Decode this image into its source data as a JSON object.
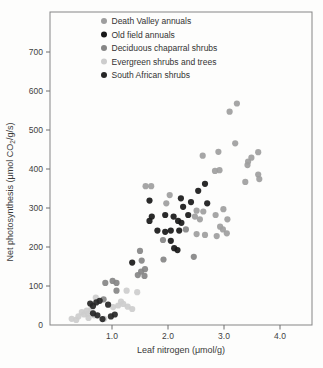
{
  "figure": {
    "x_tick_labels": [
      "1.0",
      "2.0",
      "3.0",
      "4.0"
    ],
    "y_tick_labels": [
      "0",
      "100",
      "200",
      "300",
      "400",
      "500",
      "600",
      "700"
    ],
    "xlabel": "Leaf nitrogen (μmol/g)",
    "ylabel_pre": "Net photosynthesis (μmol CO",
    "ylabel_sub": "2",
    "ylabel_post": "/g/s)",
    "frame_color": "#858585",
    "tick_color": "#6e6e6e",
    "label_color": "#3f3f3f"
  },
  "legend": {
    "items": [
      {
        "label": "Death Valley annuals",
        "color": "#9e9e9e"
      },
      {
        "label": "Old field annuals",
        "color": "#181818"
      },
      {
        "label": "Deciduous chaparral shrubs",
        "color": "#868686"
      },
      {
        "label": "Evergreen shrubs and trees",
        "color": "#cdcdcd"
      },
      {
        "label": "South African shrubs",
        "color": "#262626"
      }
    ]
  },
  "chart_data": {
    "type": "scatter",
    "title": "",
    "xlabel": "Leaf nitrogen (μmol/g)",
    "ylabel": "Net photosynthesis (μmol CO2/g/s)",
    "xlim": [
      0,
      4.6
    ],
    "ylim": [
      0,
      800
    ],
    "x_ticks": [
      1.0,
      2.0,
      3.0,
      4.0
    ],
    "y_ticks": [
      0,
      100,
      200,
      300,
      400,
      500,
      600,
      700
    ],
    "grid": false,
    "legend_position": "top-inside",
    "series": [
      {
        "name": "Evergreen shrubs and trees",
        "color": "#cdcdcd",
        "points": [
          [
            0.28,
            16
          ],
          [
            0.36,
            13
          ],
          [
            0.4,
            22
          ],
          [
            0.46,
            33
          ],
          [
            0.5,
            27
          ],
          [
            0.55,
            37
          ],
          [
            0.57,
            29
          ],
          [
            0.58,
            18
          ],
          [
            0.63,
            40
          ],
          [
            0.68,
            25
          ],
          [
            0.71,
            70
          ],
          [
            0.86,
            16
          ],
          [
            1.02,
            46
          ],
          [
            1.11,
            50
          ],
          [
            1.16,
            60
          ],
          [
            1.2,
            54
          ],
          [
            1.26,
            88
          ],
          [
            1.28,
            47
          ],
          [
            1.36,
            41
          ],
          [
            1.45,
            84
          ]
        ]
      },
      {
        "name": "Deciduous chaparral shrubs",
        "color": "#868686",
        "points": [
          [
            2.32,
            245
          ],
          [
            2.46,
            175
          ],
          [
            1.91,
            218
          ],
          [
            1.92,
            168
          ],
          [
            1.5,
            190
          ],
          [
            1.53,
            165
          ],
          [
            1.59,
            143
          ],
          [
            1.52,
            137
          ],
          [
            1.46,
            128
          ],
          [
            1.58,
            126
          ],
          [
            1.01,
            113
          ],
          [
            0.88,
            108
          ],
          [
            1.08,
            108
          ],
          [
            1.08,
            88
          ],
          [
            0.85,
            66
          ]
        ]
      },
      {
        "name": "Death Valley annuals",
        "color": "#9e9e9e",
        "points": [
          [
            3.23,
            568
          ],
          [
            3.1,
            547
          ],
          [
            3.2,
            466
          ],
          [
            2.9,
            444
          ],
          [
            2.62,
            434
          ],
          [
            3.61,
            443
          ],
          [
            3.49,
            429
          ],
          [
            3.43,
            419
          ],
          [
            3.42,
            410
          ],
          [
            2.92,
            397
          ],
          [
            2.84,
            395
          ],
          [
            3.61,
            386
          ],
          [
            3.63,
            374
          ],
          [
            3.38,
            367
          ],
          [
            1.6,
            356
          ],
          [
            1.7,
            356
          ],
          [
            2.03,
            333
          ],
          [
            1.97,
            312
          ],
          [
            2.99,
            297
          ],
          [
            2.51,
            293
          ],
          [
            2.63,
            291
          ],
          [
            2.85,
            282
          ],
          [
            2.48,
            278
          ],
          [
            2.57,
            271
          ],
          [
            3.06,
            271
          ],
          [
            2.93,
            252
          ],
          [
            2.98,
            245
          ],
          [
            3.05,
            235
          ],
          [
            2.51,
            233
          ],
          [
            2.66,
            231
          ],
          [
            2.87,
            228
          ]
        ]
      },
      {
        "name": "Old field annuals",
        "color": "#181818",
        "points": [
          [
            2.66,
            362
          ],
          [
            2.54,
            344
          ],
          [
            2.23,
            325
          ],
          [
            1.67,
            319
          ],
          [
            2.41,
            315
          ],
          [
            2.7,
            312
          ],
          [
            2.27,
            303
          ],
          [
            1.95,
            282
          ],
          [
            2.36,
            282
          ],
          [
            1.71,
            278
          ],
          [
            2.1,
            278
          ],
          [
            1.67,
            267
          ],
          [
            2.18,
            267
          ],
          [
            2.24,
            262
          ],
          [
            1.81,
            242
          ],
          [
            2.05,
            242
          ],
          [
            2.2,
            242
          ],
          [
            1.95,
            239
          ],
          [
            2.05,
            216
          ],
          [
            2.11,
            197
          ],
          [
            2.17,
            192
          ],
          [
            1.36,
            160
          ]
        ]
      },
      {
        "name": "South African shrubs",
        "color": "#262626",
        "points": [
          [
            0.61,
            55
          ],
          [
            0.66,
            49
          ],
          [
            0.72,
            58
          ],
          [
            0.78,
            62
          ],
          [
            0.93,
            52
          ],
          [
            0.66,
            30
          ],
          [
            0.74,
            25
          ],
          [
            0.83,
            15
          ],
          [
            0.98,
            22
          ],
          [
            1.05,
            27
          ]
        ]
      }
    ]
  }
}
